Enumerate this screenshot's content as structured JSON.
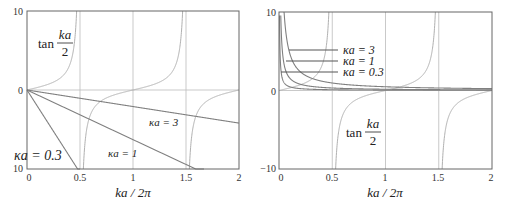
{
  "chart_data": [
    {
      "type": "line",
      "title": "",
      "xlabel": "ka / 2π",
      "ylabel": "",
      "xlim": [
        0,
        2
      ],
      "ylim": [
        -10,
        10
      ],
      "xticks": [
        "0",
        "0.5",
        "1",
        "1.5",
        "2"
      ],
      "yticks": [
        "10",
        "0",
        "10"
      ],
      "grid": "vertical lines at 0.5, 1, 1.5 and horizontal line at 0",
      "series": [
        {
          "name": "tan(ka/2)",
          "function": "tan(pi*x)",
          "label": "tan ka/2"
        },
        {
          "name": "κa = 0.3",
          "function": "-2*pi*x/0.3",
          "points": [
            [
              0,
              0
            ],
            [
              0.477,
              -10
            ]
          ]
        },
        {
          "name": "κa = 1",
          "function": "-2*pi*x/1",
          "points": [
            [
              0,
              0
            ],
            [
              1.59,
              -10
            ]
          ]
        },
        {
          "name": "κa = 3",
          "function": "-2*pi*x/3",
          "points": [
            [
              0,
              0
            ],
            [
              2,
              -4.19
            ]
          ]
        }
      ],
      "annotations": [
        "tan ka/2",
        "κa = 0.3",
        "κa = 1",
        "κa = 3"
      ]
    },
    {
      "type": "line",
      "title": "",
      "xlabel": "ka / 2π",
      "ylabel": "",
      "xlim": [
        0,
        2
      ],
      "ylim": [
        -10,
        10
      ],
      "xticks": [
        "0",
        "0.5",
        "1",
        "1.5",
        "2"
      ],
      "yticks": [
        "10",
        "0",
        "−10"
      ],
      "grid": "vertical lines at 0.5, 1, 1.5 and horizontal line at 0",
      "series": [
        {
          "name": "tan(ka/2)",
          "function": "tan(pi*x)",
          "label": "tan ka/2"
        },
        {
          "name": "κa = 0.3",
          "function": "0.3/(2*pi*x)",
          "points": [
            [
              0.005,
              9.5
            ],
            [
              0.05,
              0.95
            ],
            [
              0.5,
              0.095
            ],
            [
              1.8,
              0.027
            ]
          ]
        },
        {
          "name": "κa = 1",
          "function": "1/(2*pi*x)",
          "points": [
            [
              0.016,
              10
            ],
            [
              0.1,
              1.59
            ],
            [
              0.5,
              0.32
            ],
            [
              1.8,
              0.088
            ]
          ]
        },
        {
          "name": "κa = 3",
          "function": "3/(2*pi*x)",
          "points": [
            [
              0.048,
              10
            ],
            [
              0.2,
              2.39
            ],
            [
              1,
              0.48
            ],
            [
              1.35,
              0.35
            ]
          ]
        }
      ],
      "annotations": [
        "κa = 3",
        "κa = 1",
        "κa = 0.3",
        "tan ka/2"
      ]
    }
  ],
  "left": {
    "tan_label": "tan",
    "frac_num": "ka",
    "frac_den": "2",
    "labels": {
      "k03": "κa = 0.3",
      "k1": "κa = 1",
      "k3": "κa = 3"
    },
    "xlabel": "ka / 2π",
    "xticks": [
      "0",
      "0.5",
      "1",
      "1.5",
      "2"
    ],
    "ytop": "10",
    "yzero": "0",
    "ybottom": "10"
  },
  "right": {
    "tan_label": "tan",
    "frac_num": "ka",
    "frac_den": "2",
    "labels": {
      "k3": "κa = 3",
      "k1": "κa = 1",
      "k03": "κa = 0.3"
    },
    "xlabel": "ka / 2π",
    "xticks": [
      "0",
      "0.5",
      "1",
      "1.5",
      "2"
    ],
    "ytop": "10",
    "yzero": "0",
    "ybottom": "−10"
  },
  "colors": {
    "frame": "#666666",
    "grid": "#bbbbbb",
    "tan_curve": "#b0b0b0",
    "lines": "#808080",
    "text": "#222222"
  }
}
